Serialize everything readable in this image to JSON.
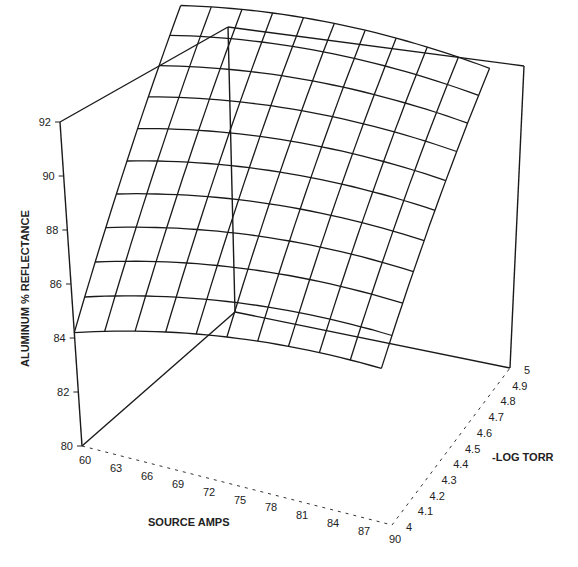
{
  "chart_data": {
    "type": "surface3d",
    "title": "",
    "zlabel": "ALUMINUM % REFLECTANCE",
    "xlabel": "SOURCE AMPS",
    "ylabel": "-LOG TORR",
    "z_ticks": [
      "80",
      "82",
      "84",
      "86",
      "88",
      "90",
      "92"
    ],
    "x_ticks": [
      "60",
      "63",
      "66",
      "69",
      "72",
      "75",
      "78",
      "81",
      "84",
      "87",
      "90"
    ],
    "y_ticks": [
      "4",
      "4.1",
      "4.2",
      "4.3",
      "4.4",
      "4.5",
      "4.6",
      "4.7",
      "4.8",
      "4.9",
      "5"
    ],
    "zlim": [
      80,
      92
    ],
    "xlim": [
      60,
      90
    ],
    "ylim": [
      4,
      5
    ],
    "grid": false,
    "surface": {
      "description": "Wireframe response surface of reflectance vs source amps and -log torr; dome rising toward high amps / high -log torr",
      "x": [
        60,
        63,
        66,
        69,
        72,
        75,
        78,
        81,
        84,
        87,
        90
      ],
      "y": [
        4.0,
        4.1,
        4.2,
        4.3,
        4.4,
        4.5,
        4.6,
        4.7,
        4.8,
        4.9,
        5.0
      ],
      "z_corners": {
        "x60_y4.0": 84.1,
        "x90_y4.0": 85.8,
        "x60_y5.0": 90.6,
        "x90_y5.0": 91.6
      },
      "z_peak_approx": 92
    }
  },
  "axes": {
    "z_label": "ALUMINUM % REFLECTANCE",
    "x_label": "SOURCE AMPS",
    "y_label": "-LOG TORR"
  }
}
